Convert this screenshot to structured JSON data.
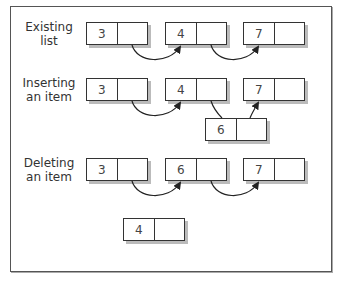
{
  "diagram": {
    "sections": [
      {
        "label_line1": "Existing",
        "label_line2": "list",
        "nodes": [
          "3",
          "4",
          "7"
        ]
      },
      {
        "label_line1": "Inserting",
        "label_line2": "an item",
        "nodes": [
          "3",
          "4",
          "7"
        ],
        "inserted_node": "6"
      },
      {
        "label_line1": "Deleting",
        "label_line2": "an item",
        "nodes": [
          "3",
          "6",
          "7"
        ],
        "removed_node": "4"
      }
    ],
    "colors": {
      "border": "#333333",
      "shadow": "#bbbbbb",
      "text": "#444444",
      "frame": "#555555"
    }
  }
}
